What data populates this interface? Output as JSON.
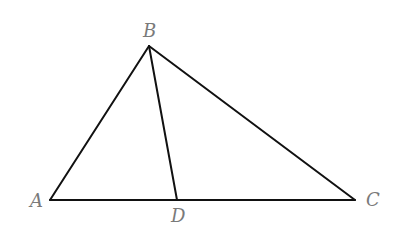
{
  "diagram": {
    "type": "triangle-with-cevian",
    "points": {
      "A": {
        "label": "A",
        "x": 50,
        "y": 200
      },
      "B": {
        "label": "B",
        "x": 149,
        "y": 46
      },
      "C": {
        "label": "C",
        "x": 355,
        "y": 200
      },
      "D": {
        "label": "D",
        "x": 177,
        "y": 200
      }
    },
    "segments": [
      {
        "from": "A",
        "to": "B"
      },
      {
        "from": "B",
        "to": "C"
      },
      {
        "from": "A",
        "to": "C"
      },
      {
        "from": "B",
        "to": "D"
      }
    ],
    "labels": {
      "A": "A",
      "B": "B",
      "C": "C",
      "D": "D"
    },
    "colors": {
      "line": "#111111",
      "label": "#7a7a7a",
      "background": "#ffffff"
    }
  }
}
